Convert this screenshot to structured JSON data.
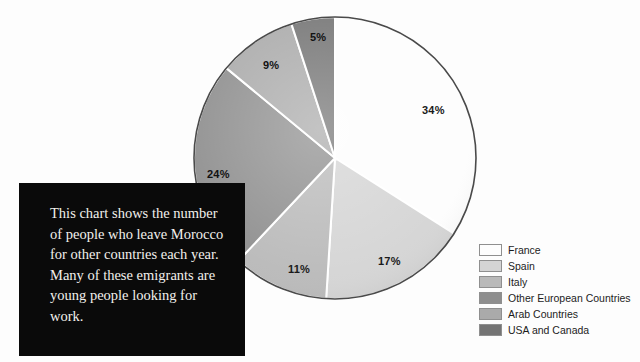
{
  "page": {
    "background_color": "#fdfdfd"
  },
  "caption": {
    "text": "This chart shows the number of people who leave Morocco for other countries each year. Many of these emigrants are young people looking for work.",
    "background_color": "#0a0a0a",
    "text_color": "#f2f0ec"
  },
  "legend": {
    "position": "right",
    "items": [
      {
        "label": "France",
        "color": "#fdfdfd"
      },
      {
        "label": "Spain",
        "color": "#d4d4d4"
      },
      {
        "label": "Italy",
        "color": "#b9b9b9"
      },
      {
        "label": "Other European Countries",
        "color": "#8e8e8e"
      },
      {
        "label": "Arab Countries",
        "color": "#aaaaaa"
      },
      {
        "label": "USA and Canada",
        "color": "#747474"
      }
    ]
  },
  "chart_data": {
    "type": "pie",
    "title": "",
    "subtitle": "",
    "xlabel": "",
    "ylabel": "",
    "legend_position": "right",
    "grid": false,
    "start_angle_deg": 0,
    "direction": "clockwise",
    "categories": [
      "France",
      "Spain",
      "Italy",
      "Other European Countries",
      "Arab Countries",
      "USA and Canada"
    ],
    "values": [
      34,
      17,
      11,
      24,
      9,
      5
    ],
    "value_unit": "%",
    "colors": [
      "#fdfdfd",
      "#d4d4d4",
      "#b9b9b9",
      "#8e8e8e",
      "#aaaaaa",
      "#747474"
    ],
    "slices": [
      {
        "label": "France",
        "value": 34,
        "display": "34%",
        "color": "#fdfdfd"
      },
      {
        "label": "Spain",
        "value": 17,
        "display": "17%",
        "color": "#d4d4d4"
      },
      {
        "label": "Italy",
        "value": 11,
        "display": "11%",
        "color": "#b9b9b9"
      },
      {
        "label": "Other European Countries",
        "value": 24,
        "display": "24%",
        "color": "#8e8e8e"
      },
      {
        "label": "Arab Countries",
        "value": 9,
        "display": "9%",
        "color": "#aaaaaa"
      },
      {
        "label": "USA and Canada",
        "value": 5,
        "display": "5%",
        "color": "#747474"
      }
    ],
    "annotations": [
      "This chart shows the number of people who leave Morocco for other countries each year. Many of these emigrants are young people looking for work."
    ]
  }
}
